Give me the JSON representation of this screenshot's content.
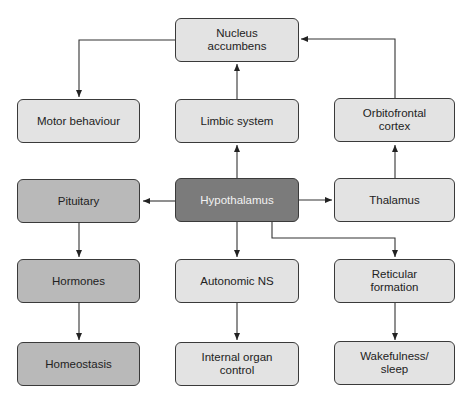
{
  "diagram": {
    "nodes": {
      "nucleus_accumbens": "Nucleus\naccumbens",
      "motor_behaviour": "Motor behaviour",
      "limbic_system": "Limbic system",
      "orbitofrontal_cortex": "Orbitofrontal\ncortex",
      "pituitary": "Pituitary",
      "hypothalamus": "Hypothalamus",
      "thalamus": "Thalamus",
      "hormones": "Hormones",
      "autonomic_ns": "Autonomic NS",
      "reticular_formation": "Reticular\nformation",
      "homeostasis": "Homeostasis",
      "internal_organ_control": "Internal organ\ncontrol",
      "wakefulness_sleep": "Wakefulness/\nsleep"
    },
    "edges": [
      {
        "from": "hypothalamus",
        "to": "limbic_system"
      },
      {
        "from": "limbic_system",
        "to": "nucleus_accumbens"
      },
      {
        "from": "nucleus_accumbens",
        "to": "motor_behaviour"
      },
      {
        "from": "hypothalamus",
        "to": "thalamus"
      },
      {
        "from": "thalamus",
        "to": "orbitofrontal_cortex"
      },
      {
        "from": "orbitofrontal_cortex",
        "to": "nucleus_accumbens"
      },
      {
        "from": "hypothalamus",
        "to": "pituitary"
      },
      {
        "from": "pituitary",
        "to": "hormones"
      },
      {
        "from": "hormones",
        "to": "homeostasis"
      },
      {
        "from": "hypothalamus",
        "to": "autonomic_ns"
      },
      {
        "from": "autonomic_ns",
        "to": "internal_organ_control"
      },
      {
        "from": "hypothalamus",
        "to": "reticular_formation"
      },
      {
        "from": "reticular_formation",
        "to": "wakefulness_sleep"
      }
    ]
  }
}
